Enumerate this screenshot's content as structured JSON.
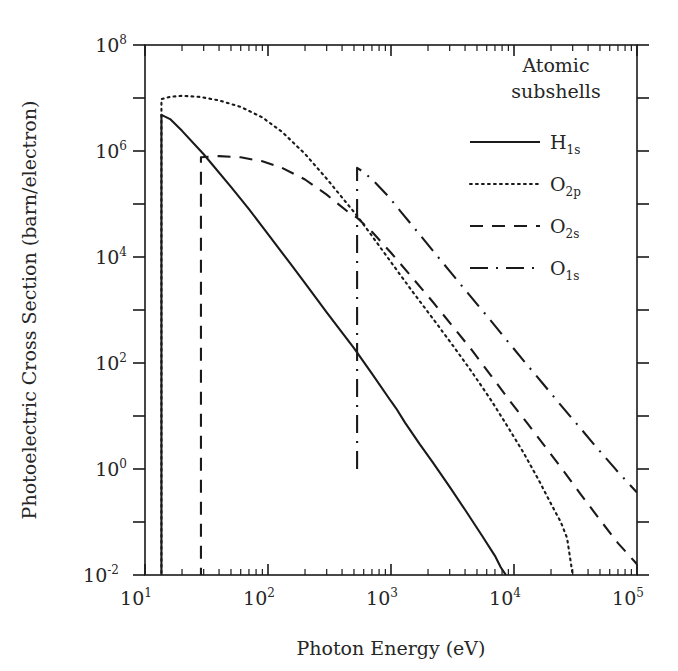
{
  "chart_data": {
    "type": "line",
    "title": "",
    "xlabel": "Photon Energy (eV)",
    "ylabel": "Photoelectric Cross Section (barn/electron)",
    "xscale": "log",
    "yscale": "log",
    "xlim": [
      10,
      100000
    ],
    "ylim": [
      0.01,
      100000000
    ],
    "grid": false,
    "xticks": [
      "10^1",
      "10^2",
      "10^3",
      "10^4",
      "10^5"
    ],
    "xtick_labels": [
      "10",
      "10",
      "10",
      "10",
      "10"
    ],
    "xtick_exps": [
      "1",
      "2",
      "3",
      "4",
      "5"
    ],
    "yticks": [
      "10^-2",
      "10^0",
      "10^2",
      "10^4",
      "10^6",
      "10^8"
    ],
    "ytick_labels": [
      "10",
      "10",
      "10",
      "10",
      "10",
      "10"
    ],
    "ytick_exps": [
      "-2",
      "0",
      "2",
      "4",
      "6",
      "8"
    ],
    "legend_position": "top-right",
    "legend_title_line1": "Atomic",
    "legend_title_line2": "subshells",
    "series": [
      {
        "name": "H_1s",
        "label_base": "H",
        "label_sub": "1s",
        "style": "solid",
        "edge_energy_eV": 13.6,
        "points": [
          [
            13.6,
            0.001
          ],
          [
            13.6,
            4800000
          ],
          [
            16,
            4000000
          ],
          [
            20,
            2400000
          ],
          [
            30,
            870000
          ],
          [
            50,
            210000
          ],
          [
            70,
            80000
          ],
          [
            100,
            27000
          ],
          [
            150,
            7800
          ],
          [
            200,
            3200
          ],
          [
            300,
            900
          ],
          [
            500,
            190
          ],
          [
            700,
            63
          ],
          [
            1000,
            19
          ],
          [
            1100,
            14
          ],
          [
            1300,
            7.5
          ],
          [
            1700,
            3.0
          ],
          [
            2200,
            1.3
          ],
          [
            3000,
            0.46
          ],
          [
            4000,
            0.17
          ],
          [
            5500,
            0.055
          ],
          [
            7000,
            0.023
          ],
          [
            7800,
            0.014
          ],
          [
            8600,
            0.01
          ]
        ]
      },
      {
        "name": "O_2p",
        "label_base": "O",
        "label_sub": "2p",
        "style": "dotted",
        "edge_energy_eV": 13.6,
        "points": [
          [
            13.6,
            0.001
          ],
          [
            13.6,
            9500000
          ],
          [
            16,
            10500000
          ],
          [
            20,
            11000000
          ],
          [
            28,
            10500000
          ],
          [
            40,
            9000000
          ],
          [
            60,
            6800000
          ],
          [
            90,
            4300000
          ],
          [
            130,
            2300000
          ],
          [
            200,
            880000
          ],
          [
            300,
            300000
          ],
          [
            450,
            95000
          ],
          [
            530,
            60000
          ],
          [
            700,
            25000
          ],
          [
            1000,
            8000
          ],
          [
            1500,
            2200
          ],
          [
            2200,
            680
          ],
          [
            3200,
            210
          ],
          [
            4500,
            70
          ],
          [
            6500,
            20
          ],
          [
            9000,
            6.0
          ],
          [
            12000,
            2.0
          ],
          [
            16000,
            0.6
          ],
          [
            20000,
            0.22
          ],
          [
            24000,
            0.1
          ],
          [
            27000,
            0.05
          ],
          [
            30000,
            0.01
          ]
        ]
      },
      {
        "name": "O_2s",
        "label_base": "O",
        "label_sub": "2s",
        "style": "dashed",
        "edge_energy_eV": 28.5,
        "points": [
          [
            28.5,
            0.001
          ],
          [
            28.5,
            760000
          ],
          [
            40,
            800000
          ],
          [
            60,
            760000
          ],
          [
            90,
            640000
          ],
          [
            130,
            480000
          ],
          [
            200,
            290000
          ],
          [
            300,
            150000
          ],
          [
            450,
            70000
          ],
          [
            530,
            55000
          ],
          [
            700,
            30000
          ],
          [
            1000,
            12000
          ],
          [
            1500,
            4000
          ],
          [
            2200,
            1400
          ],
          [
            3200,
            480
          ],
          [
            4500,
            180
          ],
          [
            6500,
            58
          ],
          [
            9000,
            21
          ],
          [
            13000,
            7.0
          ],
          [
            18000,
            2.6
          ],
          [
            25000,
            0.95
          ],
          [
            35000,
            0.33
          ],
          [
            50000,
            0.11
          ],
          [
            70000,
            0.04
          ],
          [
            100000,
            0.016
          ]
        ]
      },
      {
        "name": "O_1s",
        "label_base": "O",
        "label_sub": "1s",
        "style": "dashdot",
        "edge_energy_eV": 530,
        "points": [
          [
            530,
            1.0
          ],
          [
            530,
            480000
          ],
          [
            600,
            400000
          ],
          [
            750,
            250000
          ],
          [
            950,
            140000
          ],
          [
            1200,
            72000
          ],
          [
            1600,
            32000
          ],
          [
            2200,
            13000
          ],
          [
            3000,
            5400
          ],
          [
            4200,
            2100
          ],
          [
            6000,
            780
          ],
          [
            8500,
            290
          ],
          [
            12000,
            110
          ],
          [
            17000,
            42
          ],
          [
            24000,
            16
          ],
          [
            34000,
            6.2
          ],
          [
            48000,
            2.4
          ],
          [
            68000,
            0.95
          ],
          [
            100000,
            0.36
          ]
        ]
      }
    ]
  },
  "axes": {
    "x_axis_name": "photon-energy-axis",
    "y_axis_name": "cross-section-axis"
  }
}
